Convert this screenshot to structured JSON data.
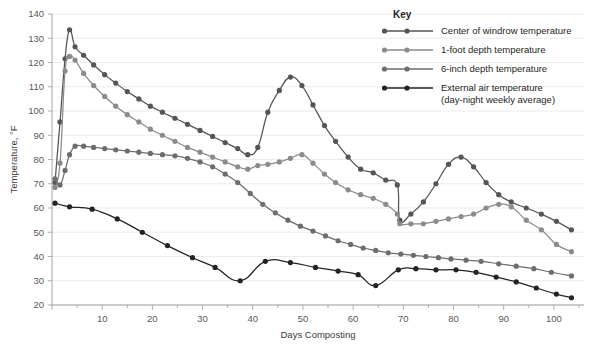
{
  "chart_data": {
    "type": "line",
    "title": "",
    "xlabel": "Days Composting",
    "ylabel": "Temperature, °F",
    "xlim": [
      0,
      106
    ],
    "ylim": [
      20,
      140
    ],
    "ytick_step": 10,
    "xtick_step": 10,
    "x_minor_step": 5,
    "grid": true,
    "grid_axis": "y",
    "legend_position": "top-right",
    "legend_title": "Key",
    "xticks": [
      10,
      20,
      30,
      40,
      50,
      60,
      70,
      80,
      90,
      100
    ],
    "yticks": [
      20,
      30,
      40,
      50,
      60,
      70,
      80,
      90,
      100,
      110,
      120,
      130,
      140
    ],
    "series": [
      {
        "name": "Center of windrow temperature",
        "color": "#555557",
        "x": [
          0.6,
          1.6,
          2.6,
          3.5,
          4.6,
          6.3,
          8.3,
          10.5,
          12.7,
          15.0,
          17.3,
          19.6,
          22.0,
          24.5,
          27.0,
          29.5,
          32.0,
          34.5,
          37.0,
          39.0,
          41.0,
          43.0,
          45.3,
          47.5,
          49.8,
          52.0,
          54.3,
          56.5,
          59.0,
          61.5,
          64.0,
          66.5,
          68.8,
          69.3,
          71.5,
          74.0,
          76.5,
          79.0,
          81.5,
          84.0,
          86.5,
          89.0,
          91.5,
          94.5,
          97.5,
          100.5,
          103.5
        ],
        "y": [
          70.5,
          95.5,
          121.5,
          133.5,
          126.5,
          123.0,
          119.0,
          115.0,
          111.5,
          108.0,
          105.0,
          102.0,
          99.5,
          97.0,
          94.5,
          92.0,
          89.5,
          87.0,
          84.5,
          82.0,
          85.0,
          99.5,
          108.5,
          114.0,
          110.5,
          102.5,
          94.0,
          87.5,
          81.0,
          76.0,
          74.5,
          71.5,
          69.5,
          55.0,
          57.5,
          62.5,
          70.0,
          78.0,
          81.0,
          77.0,
          70.5,
          65.5,
          62.5,
          60.0,
          57.5,
          54.5,
          51.0
        ]
      },
      {
        "name": "1-foot depth temperature",
        "color": "#8b8b8d",
        "x": [
          0.6,
          1.6,
          2.6,
          3.5,
          4.6,
          6.3,
          8.3,
          10.5,
          12.7,
          15.0,
          17.3,
          19.6,
          22.0,
          24.5,
          27.0,
          29.5,
          32.0,
          34.5,
          37.0,
          39.0,
          41.0,
          43.0,
          45.3,
          47.5,
          49.8,
          52.0,
          54.3,
          56.5,
          59.0,
          61.5,
          64.0,
          66.5,
          68.8,
          69.3,
          71.5,
          74.0,
          76.5,
          79.0,
          81.5,
          84.0,
          86.5,
          89.0,
          91.5,
          94.5,
          97.5,
          100.5,
          103.5
        ],
        "y": [
          68.5,
          78.5,
          116.5,
          122.5,
          121.0,
          115.5,
          110.5,
          106.0,
          102.0,
          98.5,
          95.5,
          92.5,
          90.0,
          87.5,
          85.0,
          83.0,
          81.0,
          79.0,
          77.0,
          76.0,
          77.5,
          78.0,
          79.0,
          80.5,
          82.0,
          78.5,
          74.0,
          70.5,
          67.5,
          65.5,
          64.0,
          61.5,
          57.5,
          53.5,
          53.5,
          53.5,
          54.5,
          55.5,
          56.5,
          57.5,
          60.0,
          61.5,
          60.5,
          55.0,
          51.0,
          45.0,
          42.0
        ]
      },
      {
        "name": "6-inch depth temperature",
        "color": "#6d6d6f",
        "x": [
          0.6,
          1.6,
          2.6,
          3.5,
          4.6,
          6.3,
          8.3,
          10.5,
          12.7,
          15.0,
          17.3,
          19.6,
          22.0,
          24.5,
          27.0,
          29.5,
          32.0,
          34.5,
          37.0,
          39.5,
          42.0,
          44.5,
          47.0,
          49.5,
          52.0,
          54.5,
          57.0,
          59.5,
          62.0,
          64.5,
          67.0,
          69.5,
          72.0,
          74.5,
          77.0,
          79.5,
          82.5,
          85.5,
          89.0,
          92.5,
          96.0,
          99.5,
          103.5
        ],
        "y": [
          72.0,
          69.5,
          75.5,
          82.0,
          85.5,
          85.5,
          85.0,
          84.5,
          84.0,
          83.5,
          83.0,
          82.5,
          82.0,
          81.5,
          80.5,
          79.0,
          77.0,
          74.0,
          70.5,
          66.0,
          61.5,
          58.0,
          55.0,
          52.5,
          50.5,
          48.5,
          46.5,
          45.0,
          43.5,
          42.5,
          41.5,
          41.0,
          40.5,
          40.0,
          39.5,
          39.0,
          38.5,
          38.0,
          37.0,
          36.0,
          35.0,
          33.5,
          32.0
        ]
      },
      {
        "name": "External air temperature\n(day-night weekly average)",
        "color": "#232325",
        "x": [
          0.6,
          3.5,
          8.0,
          13.0,
          18.0,
          23.0,
          28.0,
          32.5,
          37.5,
          42.5,
          47.5,
          52.5,
          57.0,
          61.0,
          64.5,
          69.0,
          72.5,
          76.5,
          80.5,
          84.5,
          88.5,
          92.5,
          96.5,
          100.5,
          103.5
        ],
        "y": [
          62.0,
          60.5,
          59.5,
          55.5,
          50.0,
          44.5,
          39.5,
          35.5,
          30.0,
          38.0,
          37.5,
          35.5,
          34.0,
          32.5,
          28.0,
          34.5,
          35.0,
          34.5,
          34.5,
          33.5,
          31.5,
          29.5,
          27.0,
          24.5,
          23.0
        ]
      }
    ]
  },
  "legend": {
    "title": "Key",
    "entries": [
      {
        "label": "Center of windrow temperature",
        "color": "#555557",
        "line2": ""
      },
      {
        "label": "1-foot depth temperature",
        "color": "#8b8b8d",
        "line2": ""
      },
      {
        "label": "6-inch depth temperature",
        "color": "#6d6d6f",
        "line2": ""
      },
      {
        "label": "External air temperature",
        "color": "#232325",
        "line2": "(day-night weekly average)"
      }
    ]
  },
  "axes": {
    "x_title": "Days Composting",
    "y_title": "Temperature, °F"
  }
}
